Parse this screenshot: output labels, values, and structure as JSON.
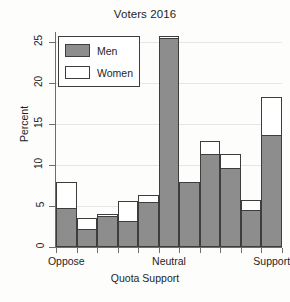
{
  "chart_data": {
    "type": "bar",
    "title": "Voters 2016",
    "xlabel": "Quota Support",
    "ylabel": "Percent",
    "ylim": [
      0,
      26.5
    ],
    "yticks": [
      0,
      5,
      10,
      15,
      20,
      25
    ],
    "ytick_labels": [
      "0",
      "5",
      "10",
      "15",
      "20",
      "25"
    ],
    "xtick_positions": [
      0,
      5,
      10
    ],
    "xtick_labels": [
      "Oppose",
      "Neutral",
      "Support"
    ],
    "categories": [
      "0",
      "1",
      "2",
      "3",
      "4",
      "5",
      "6",
      "7",
      "8",
      "9",
      "10"
    ],
    "grid": true,
    "grid_axis": "y",
    "legend_position": "upper-left",
    "series": [
      {
        "name": "Men",
        "color": "#8d8d8d",
        "values": [
          4.8,
          2.2,
          3.8,
          3.2,
          5.5,
          25.5,
          8.0,
          11.4,
          9.7,
          4.5,
          13.7
        ]
      },
      {
        "name": "Women",
        "color": "#ffffff",
        "values": [
          7.9,
          3.5,
          4.0,
          5.6,
          6.4,
          25.8,
          8.0,
          12.9,
          11.4,
          5.7,
          18.3
        ]
      }
    ]
  },
  "legend": {
    "entries": [
      {
        "label": "Men",
        "swatch": "#8d8d8d"
      },
      {
        "label": "Women",
        "swatch": "#ffffff"
      }
    ]
  }
}
